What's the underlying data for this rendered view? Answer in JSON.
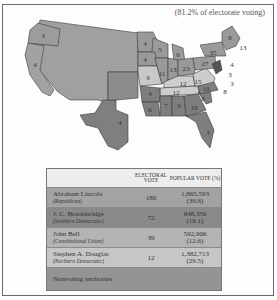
{
  "caption": "(81.2% of electorate voting)",
  "colors": {
    "lincoln": "#9a9a9a",
    "breckinridge": "#7e7e7e",
    "bell": "#cfcfcf",
    "douglas": "#bdbdbd",
    "nonvoting": "#8c8c8c",
    "territory": "#a5a5a5",
    "border": "#3a3a3a"
  },
  "map": {
    "state_labels": [
      {
        "state": "Oregon",
        "votes": "3",
        "winner": "lincoln"
      },
      {
        "state": "California",
        "votes": "4",
        "winner": "lincoln"
      },
      {
        "state": "Minnesota",
        "votes": "4",
        "winner": "lincoln"
      },
      {
        "state": "Wisconsin",
        "votes": "5",
        "winner": "lincoln"
      },
      {
        "state": "Michigan",
        "votes": "6",
        "winner": "lincoln"
      },
      {
        "state": "Iowa",
        "votes": "4",
        "winner": "lincoln"
      },
      {
        "state": "Illinois",
        "votes": "11",
        "winner": "lincoln"
      },
      {
        "state": "Indiana",
        "votes": "13",
        "winner": "lincoln"
      },
      {
        "state": "Ohio",
        "votes": "23",
        "winner": "lincoln"
      },
      {
        "state": "Pennsylvania",
        "votes": "27",
        "winner": "lincoln"
      },
      {
        "state": "New York",
        "votes": "35",
        "winner": "lincoln"
      },
      {
        "state": "Maine",
        "votes": "8",
        "winner": "lincoln"
      },
      {
        "state": "Massachusetts",
        "votes": "13",
        "winner": "lincoln"
      },
      {
        "state": "Rhode Island",
        "votes": "4",
        "winner": "lincoln"
      },
      {
        "state": "Connecticut",
        "votes": "6",
        "winner": "lincoln"
      },
      {
        "state": "Vermont",
        "votes": "5",
        "winner": "lincoln"
      },
      {
        "state": "New Hampshire",
        "votes": "5",
        "winner": "lincoln"
      },
      {
        "state": "New Jersey",
        "votes": "4",
        "winner": "lincoln"
      },
      {
        "state": "New Jersey (Douglas)",
        "votes": "3",
        "winner": "douglas"
      },
      {
        "state": "Missouri",
        "votes": "9",
        "winner": "douglas"
      },
      {
        "state": "Kentucky",
        "votes": "12",
        "winner": "bell"
      },
      {
        "state": "Tennessee",
        "votes": "12",
        "winner": "bell"
      },
      {
        "state": "Virginia",
        "votes": "15",
        "winner": "bell"
      },
      {
        "state": "Maryland",
        "votes": "8",
        "winner": "breckinridge"
      },
      {
        "state": "Delaware",
        "votes": "3",
        "winner": "breckinridge"
      },
      {
        "state": "North Carolina",
        "votes": "10",
        "winner": "breckinridge"
      },
      {
        "state": "South Carolina",
        "votes": "8",
        "winner": "breckinridge"
      },
      {
        "state": "Georgia",
        "votes": "10",
        "winner": "breckinridge"
      },
      {
        "state": "Alabama",
        "votes": "9",
        "winner": "breckinridge"
      },
      {
        "state": "Mississippi",
        "votes": "7",
        "winner": "breckinridge"
      },
      {
        "state": "Louisiana",
        "votes": "6",
        "winner": "breckinridge"
      },
      {
        "state": "Arkansas",
        "votes": "4",
        "winner": "breckinridge"
      },
      {
        "state": "Texas",
        "votes": "4",
        "winner": "breckinridge"
      },
      {
        "state": "Florida",
        "votes": "3",
        "winner": "breckinridge"
      }
    ]
  },
  "table": {
    "headers": {
      "electoral": "ELECTORAL VOTE",
      "popular": "POPULAR VOTE (%)"
    },
    "rows": [
      {
        "name": "Abraham Lincoln",
        "party": "(Republican)",
        "electoral": "180",
        "popular": "1,865,593",
        "percent": "(39.8)",
        "color": "#a3a3a3"
      },
      {
        "name": "J. C. Breckinridge",
        "party": "(Southern Democratic)",
        "electoral": "72",
        "popular": "848,356",
        "percent": "(18.1)",
        "color": "#8a8a8a"
      },
      {
        "name": "John Bell",
        "party": "(Constitutional Union)",
        "electoral": "39",
        "popular": "592,906",
        "percent": "(12.6)",
        "color": "#b4b4b4"
      },
      {
        "name": "Stephen A. Douglas",
        "party": "(Northern Democratic)",
        "electoral": "12",
        "popular": "1,382,713",
        "percent": "(29.5)",
        "color": "#c6c6c6"
      }
    ],
    "footer": "Nonvoting territories",
    "footer_color": "#949494"
  }
}
